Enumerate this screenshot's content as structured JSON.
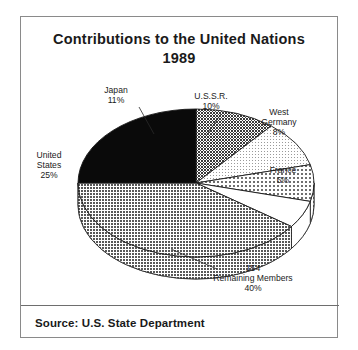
{
  "figure": {
    "title_lines": [
      "Contributions to the United Nations",
      "1989"
    ],
    "source": "Source: U.S. State Department",
    "frame_color": "#8a8a8a"
  },
  "chart_data": {
    "type": "pie",
    "title": "Contributions to the United Nations 1989",
    "subtitle": "1989",
    "xlabel": "",
    "ylabel": "",
    "grid": false,
    "legend": "none",
    "three_d": true,
    "units": "percent",
    "categories": [
      "Japan",
      "U.S.S.R.",
      "West Germany",
      "France",
      "154 Remaining Members",
      "United States"
    ],
    "values": [
      11,
      10,
      8,
      6,
      40,
      25
    ],
    "slices": [
      {
        "name": "Japan",
        "label_lines": [
          "Japan",
          "11%"
        ],
        "value": 11,
        "fill": "dark-gray-crosshatch",
        "label_x": 95,
        "label_y": 20,
        "leader": [
          [
            118,
            34
          ],
          [
            133,
            61
          ]
        ]
      },
      {
        "name": "U.S.S.R.",
        "label_lines": [
          "U.S.S.R.",
          "10%"
        ],
        "value": 10,
        "fill": "very-light-dots",
        "label_x": 190,
        "label_y": 26,
        "leader": [
          [
            200,
            41
          ],
          [
            185,
            63
          ]
        ]
      },
      {
        "name": "West Germany",
        "label_lines": [
          "West",
          "Germany",
          "8%"
        ],
        "value": 8,
        "fill": "light-crosshatch",
        "label_x": 258,
        "label_y": 42,
        "leader": null
      },
      {
        "name": "France",
        "label_lines": [
          "France",
          "6%"
        ],
        "value": 6,
        "fill": "white",
        "label_x": 262,
        "label_y": 100,
        "leader": null
      },
      {
        "name": "154 Remaining Members",
        "label_lines": [
          "154",
          "Remaining Members",
          "40%"
        ],
        "value": 40,
        "fill": "medium-gray-check",
        "label_x": 232,
        "label_y": 198,
        "leader": [
          [
            196,
            196
          ],
          [
            150,
            176
          ]
        ]
      },
      {
        "name": "United States",
        "label_lines": [
          "United",
          "States",
          "25%"
        ],
        "value": 25,
        "fill": "black",
        "label_x": 28,
        "label_y": 85,
        "leader": null
      }
    ]
  }
}
